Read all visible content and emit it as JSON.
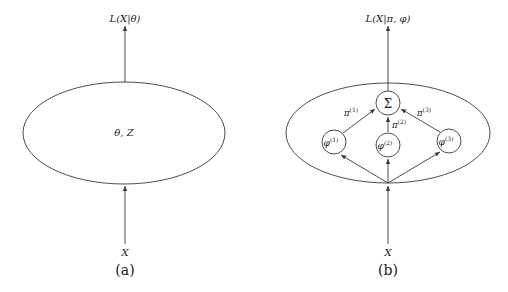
{
  "panels": [
    {
      "id": "a",
      "caption": "(a)",
      "top_label": "L(X|θ)",
      "ellipse_label": "θ, Z",
      "input_label": "X"
    },
    {
      "id": "b",
      "caption": "(b)",
      "top_label": "L(X|π, φ)",
      "sum_node": "Σ",
      "components": [
        {
          "node": "φ",
          "sup": "(1)",
          "weight": "π",
          "weight_sup": "(1)"
        },
        {
          "node": "φ",
          "sup": "(2)",
          "weight": "π",
          "weight_sup": "(2)"
        },
        {
          "node": "φ",
          "sup": "(3)",
          "weight": "π",
          "weight_sup": "(3)"
        }
      ],
      "input_label": "X"
    }
  ],
  "colors": {
    "stroke": "#3a3a3a",
    "text": "#222222",
    "background": "#ffffff"
  }
}
